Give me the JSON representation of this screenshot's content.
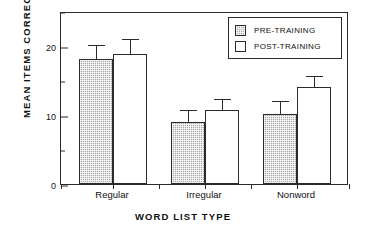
{
  "chart_data": {
    "type": "bar",
    "title": "",
    "xlabel": "WORD LIST TYPE",
    "ylabel": "MEAN ITEMS CORRECT",
    "categories": [
      "Regular",
      "Irregular",
      "Nonword"
    ],
    "ylim": [
      0,
      25
    ],
    "yticks": [
      0,
      10,
      20
    ],
    "ytick_labels": [
      "0",
      "10",
      "20"
    ],
    "yminor_ticks": [
      5,
      15,
      25
    ],
    "grid": false,
    "legend_position": "top-right",
    "series": [
      {
        "name": "PRE-TRAINING",
        "fill": "gray-stipple",
        "color": "#a9a9a9",
        "values": [
          18.1,
          8.9,
          10.1
        ],
        "errors_upper": [
          20.0,
          10.5,
          11.9
        ]
      },
      {
        "name": "POST-TRAINING",
        "fill": "white",
        "color": "#ffffff",
        "values": [
          18.8,
          10.7,
          14.0
        ],
        "errors_upper": [
          20.8,
          12.2,
          15.4
        ]
      }
    ]
  },
  "legend": {
    "items": [
      {
        "label": "PRE-TRAINING",
        "swatch": "gray-stipple-swatch"
      },
      {
        "label": "POST-TRAINING",
        "swatch": "white-swatch"
      }
    ]
  },
  "axes": {
    "y_title": "MEAN ITEMS CORRECT",
    "x_title": "WORD LIST TYPE",
    "y_labels": [
      "20",
      "10",
      "0"
    ],
    "x_labels": [
      "Regular",
      "Irregular",
      "Nonword"
    ]
  }
}
